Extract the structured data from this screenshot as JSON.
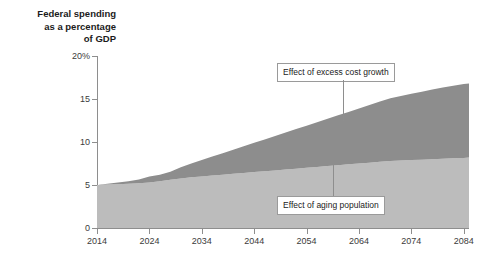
{
  "chart_data": {
    "type": "area",
    "title": "Federal spending as a percentage of GDP",
    "title_lines": [
      "Federal spending",
      "as a percentage",
      "of GDP"
    ],
    "xlabel": "",
    "ylabel": "",
    "stacked": true,
    "grid": false,
    "legend_position": "none",
    "xlim": [
      2014,
      2085
    ],
    "ylim": [
      0,
      20
    ],
    "xticks": [
      2014,
      2024,
      2034,
      2044,
      2054,
      2064,
      2074,
      2084
    ],
    "xtick_labels": [
      "2014",
      "2024",
      "2034",
      "2044",
      "2054",
      "2064",
      "2074",
      "2084"
    ],
    "yticks": [
      0,
      5,
      10,
      15,
      20
    ],
    "ytick_labels": [
      "0",
      "5",
      "10",
      "15",
      "20%"
    ],
    "x": [
      2014,
      2016,
      2018,
      2020,
      2022,
      2024,
      2026,
      2028,
      2030,
      2032,
      2034,
      2036,
      2038,
      2040,
      2042,
      2044,
      2046,
      2048,
      2050,
      2052,
      2054,
      2056,
      2058,
      2060,
      2062,
      2064,
      2066,
      2068,
      2070,
      2072,
      2074,
      2076,
      2078,
      2080,
      2082,
      2084,
      2085
    ],
    "series": [
      {
        "name": "Effect of aging population",
        "color": "#bcbcbc",
        "values": [
          5.0,
          5.05,
          5.1,
          5.15,
          5.2,
          5.3,
          5.45,
          5.6,
          5.75,
          5.9,
          6.0,
          6.1,
          6.2,
          6.3,
          6.4,
          6.5,
          6.6,
          6.7,
          6.8,
          6.9,
          7.0,
          7.1,
          7.2,
          7.3,
          7.4,
          7.5,
          7.6,
          7.7,
          7.8,
          7.85,
          7.9,
          7.95,
          8.0,
          8.05,
          8.1,
          8.15,
          8.2
        ]
      },
      {
        "name": "Effect of excess cost growth",
        "color": "#8d8d8d",
        "values": [
          0.0,
          0.1,
          0.2,
          0.3,
          0.45,
          0.7,
          0.75,
          0.95,
          1.3,
          1.6,
          1.9,
          2.2,
          2.5,
          2.8,
          3.1,
          3.4,
          3.7,
          4.0,
          4.3,
          4.6,
          4.9,
          5.2,
          5.5,
          5.8,
          6.1,
          6.4,
          6.7,
          7.0,
          7.3,
          7.5,
          7.7,
          7.9,
          8.1,
          8.3,
          8.45,
          8.6,
          8.6
        ]
      }
    ],
    "total_values": [
      5.0,
      5.15,
      5.3,
      5.45,
      5.65,
      6.0,
      6.2,
      6.55,
      7.05,
      7.5,
      7.9,
      8.3,
      8.7,
      9.1,
      9.5,
      9.9,
      10.3,
      10.7,
      11.1,
      11.5,
      11.9,
      12.3,
      12.7,
      13.1,
      13.5,
      13.9,
      14.3,
      14.7,
      15.1,
      15.35,
      15.6,
      15.85,
      16.1,
      16.35,
      16.55,
      16.75,
      16.8
    ],
    "annotations": [
      {
        "name": "excess-cost-growth",
        "label": "Effect of excess cost growth",
        "points_at_year": 2061,
        "points_at_value": 12.4
      },
      {
        "name": "aging-population",
        "label": "Effect of aging population",
        "points_at_year": 2059,
        "points_at_value": 7.3
      }
    ],
    "colors": {
      "upper_band": "#8d8d8d",
      "lower_band": "#bcbcbc",
      "axis": "#8e8e8e",
      "text": "#1b1b1b",
      "background": "#ffffff"
    }
  }
}
